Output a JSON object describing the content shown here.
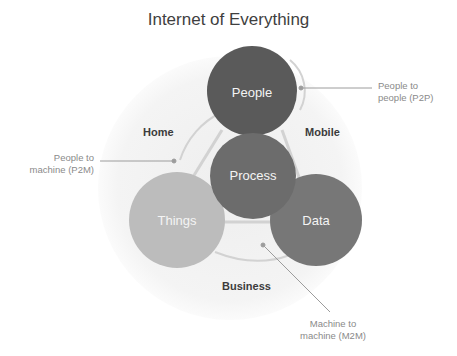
{
  "title": "Internet of Everything",
  "colors": {
    "background_disc": "#f3f3f3",
    "people": "#5b5b5b",
    "process": "#6e6e6e",
    "things": "#bdbdbd",
    "data": "#7a7a7a",
    "connector": "#cfcfcf",
    "callout_line": "#9a9a9a"
  },
  "nodes": [
    {
      "id": "people",
      "label": "People"
    },
    {
      "id": "process",
      "label": "Process"
    },
    {
      "id": "things",
      "label": "Things"
    },
    {
      "id": "data",
      "label": "Data"
    }
  ],
  "zones": {
    "home": "Home",
    "mobile": "Mobile",
    "business": "Business"
  },
  "callouts": {
    "p2p": {
      "line1": "People to",
      "line2": "people (P2P)"
    },
    "p2m": {
      "line1": "People to",
      "line2": "machine (P2M)"
    },
    "m2m": {
      "line1": "Machine to",
      "line2": "machine (M2M)"
    }
  }
}
